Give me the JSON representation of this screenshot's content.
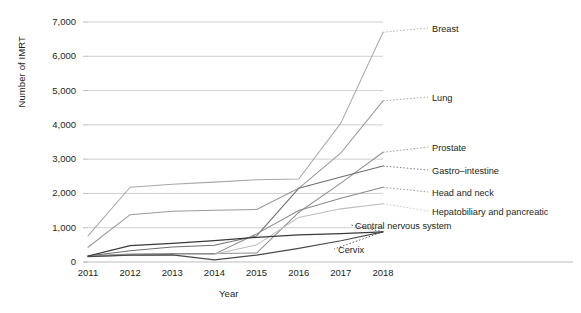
{
  "chart_data": {
    "type": "line",
    "title": "",
    "xlabel": "Year",
    "ylabel": "Number of IMRT",
    "x": [
      2011,
      2012,
      2013,
      2014,
      2015,
      2016,
      2017,
      2018
    ],
    "xlim": [
      2011,
      2018
    ],
    "ylim": [
      0,
      7000
    ],
    "yticks": [
      0,
      1000,
      2000,
      3000,
      4000,
      5000,
      6000,
      7000
    ],
    "ytick_labels": [
      "0",
      "1,000",
      "2,000",
      "3,000",
      "4,000",
      "5,000",
      "6,000",
      "7,000"
    ],
    "xtick_labels": [
      "2011",
      "2012",
      "2013",
      "2014",
      "2015",
      "2016",
      "2017",
      "2018"
    ],
    "grid": true,
    "legend_position": "right-inline-labels",
    "series": [
      {
        "name": "Breast",
        "color": "#a8a8a8",
        "values": [
          760,
          2180,
          2270,
          2330,
          2400,
          2420,
          4050,
          6700
        ]
      },
      {
        "name": "Lung",
        "color": "#9a9a9a",
        "values": [
          430,
          1380,
          1480,
          1510,
          1530,
          2150,
          3180,
          4700
        ]
      },
      {
        "name": "Prostate",
        "color": "#8f8f8f",
        "values": [
          180,
          230,
          250,
          250,
          260,
          1450,
          2300,
          3200
        ]
      },
      {
        "name": "Gastro–intestine",
        "color": "#6e6e6e",
        "values": [
          175,
          330,
          440,
          490,
          760,
          2150,
          2480,
          2800
        ]
      },
      {
        "name": "Head and neck",
        "color": "#8a8a8a",
        "values": [
          170,
          200,
          220,
          230,
          820,
          1500,
          1860,
          2180
        ]
      },
      {
        "name": "Hepatobiliary and pancreatic",
        "color": "#bdbdbd",
        "values": [
          165,
          200,
          215,
          225,
          500,
          1300,
          1550,
          1700
        ]
      },
      {
        "name": "Central nervous system",
        "color": "#3a3a3a",
        "values": [
          175,
          480,
          540,
          620,
          720,
          790,
          830,
          880
        ]
      },
      {
        "name": "Cervix",
        "color": "#4a4a4a",
        "values": [
          160,
          200,
          210,
          60,
          200,
          400,
          620,
          880
        ]
      }
    ],
    "series_labels": [
      {
        "name": "Breast",
        "label": "Breast"
      },
      {
        "name": "Lung",
        "label": "Lung"
      },
      {
        "name": "Prostate",
        "label": "Prostate"
      },
      {
        "name": "Gastro-intestine",
        "label": "Gastro–intestine"
      },
      {
        "name": "Head and neck",
        "label": "Head and neck"
      },
      {
        "name": "Hepatobiliary and pancreatic",
        "label": "Hepatobiliary and pancreatic"
      },
      {
        "name": "Central nervous system",
        "label": "Central nervous system"
      },
      {
        "name": "Cervix",
        "label": "Cervix"
      }
    ]
  },
  "axis": {
    "y_title": "Number of IMRT",
    "x_title": "Year"
  },
  "caption": {
    "text": ""
  }
}
